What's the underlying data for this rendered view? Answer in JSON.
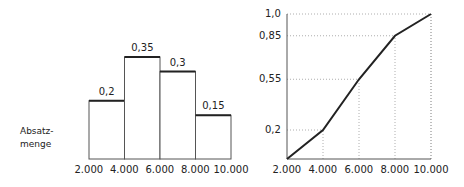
{
  "chart_data": [
    {
      "type": "bar",
      "title": "",
      "xlabel": "",
      "ylabel": "Absatzmenge",
      "side_label_lines": [
        "Absatz-",
        "menge"
      ],
      "x_ticks": [
        "2.000",
        "4.000",
        "6.000",
        "8.000",
        "10.000"
      ],
      "categories": [
        "2.000-4.000",
        "4.000-6.000",
        "6.000-8.000",
        "8.000-10.000"
      ],
      "values": [
        0.2,
        0.35,
        0.3,
        0.15
      ],
      "value_labels": [
        "0,2",
        "0,35",
        "0,3",
        "0,15"
      ],
      "ylim": [
        0,
        0.35
      ],
      "grid": false
    },
    {
      "type": "line",
      "title": "",
      "xlabel": "",
      "ylabel": "",
      "x": [
        2000,
        4000,
        6000,
        8000,
        10000
      ],
      "x_ticks": [
        "2.000",
        "4.000",
        "6.000",
        "8.000",
        "10.000"
      ],
      "values": [
        0,
        0.2,
        0.55,
        0.85,
        1.0
      ],
      "y_ticks": [
        "0,2",
        "0,55",
        "0,85",
        "1,0"
      ],
      "ylim": [
        0,
        1.0
      ],
      "grid": "dotted guide lines at data points"
    }
  ]
}
